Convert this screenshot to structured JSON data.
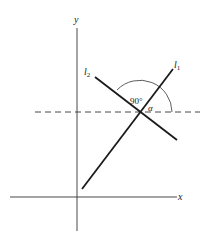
{
  "diagram": {
    "axes": {
      "x_label": "x",
      "y_label": "y"
    },
    "lines": [
      {
        "name": "l1",
        "label": "l",
        "subscript": "1"
      },
      {
        "name": "l2",
        "label": "l",
        "subscript": "2"
      }
    ],
    "angles": {
      "right_angle_label": "90°",
      "alpha_label": "α"
    },
    "colors": {
      "line": "#1a1a1a",
      "axis": "#333333",
      "background": "#ffffff"
    }
  }
}
